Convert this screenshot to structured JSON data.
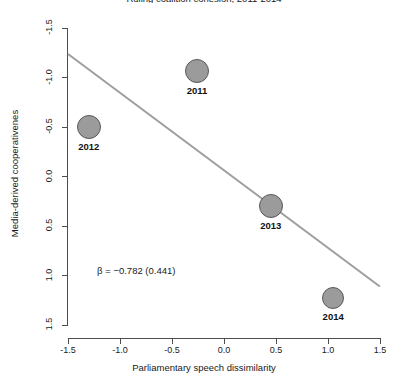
{
  "figure": {
    "title": "Ruling coalition cohesion, 2011-2014",
    "annotation": "β = −0.782 (0.441)"
  },
  "axes": {
    "xlabel": "Parliamentary speech dissimilarity",
    "ylabel": "Media-derived cooperativenes",
    "xticks": [
      "-1.5",
      "-1.0",
      "-0.5",
      "0.0",
      "0.5",
      "1.0",
      "1.5"
    ],
    "yticks": [
      "1.5",
      "1.0",
      "0.5",
      "0.0",
      "-0.5",
      "-1.0",
      "-1.5"
    ]
  },
  "points": [
    {
      "label": "2011"
    },
    {
      "label": "2012"
    },
    {
      "label": "2013"
    },
    {
      "label": "2014"
    }
  ],
  "chart_data": {
    "type": "scatter",
    "title": "Ruling coalition cohesion, 2011-2014",
    "xlabel": "Parliamentary speech dissimilarity",
    "ylabel": "Media-derived cooperativenes",
    "xlim": [
      -1.5,
      1.5
    ],
    "ylim": [
      -1.5,
      1.5
    ],
    "xticks": [
      -1.5,
      -1.0,
      -0.5,
      0.0,
      0.5,
      1.0,
      1.5
    ],
    "yticks": [
      -1.5,
      -1.0,
      -0.5,
      0.0,
      0.5,
      1.0,
      1.5
    ],
    "grid": false,
    "legend": "none",
    "point_color": "#9b9b9b",
    "point_edge_color": "#595959",
    "line_color": "#9e9e9e",
    "points": [
      {
        "label": "2011",
        "x": -0.26,
        "y": 1.07,
        "r_px": 12
      },
      {
        "label": "2012",
        "x": -1.3,
        "y": 0.5,
        "r_px": 12
      },
      {
        "label": "2013",
        "x": 0.45,
        "y": -0.3,
        "r_px": 12
      },
      {
        "label": "2014",
        "x": 1.05,
        "y": -1.23,
        "r_px": 11
      }
    ],
    "fit_line": {
      "slope": -0.782,
      "std_error": 0.441,
      "x0": -1.5,
      "y0": 1.25,
      "x1": 1.5,
      "y1": -1.1
    },
    "annotations": [
      {
        "text": "β = −0.782 (0.441)",
        "x": -1.22,
        "y": -0.95
      }
    ]
  }
}
